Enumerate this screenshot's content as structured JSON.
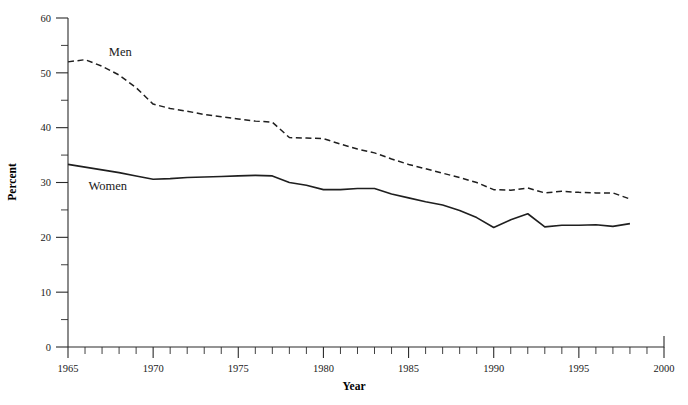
{
  "chart_data": {
    "type": "line",
    "title": "",
    "xlabel": "Year",
    "ylabel": "Percent",
    "xlim": [
      1965,
      2000
    ],
    "ylim": [
      0,
      60
    ],
    "grid": false,
    "legend_position": "inline-annotation",
    "x_major_ticks": [
      1965,
      1970,
      1975,
      1980,
      1985,
      1990,
      1995,
      2000
    ],
    "x_major_tick_labels": [
      "1965",
      "1970",
      "1975",
      "1980",
      "1985",
      "1990",
      "1995",
      "2000"
    ],
    "x_minor_tick_step": 1,
    "y_major_ticks": [
      0,
      10,
      20,
      30,
      40,
      50,
      60
    ],
    "y_major_tick_labels": [
      "0",
      "10",
      "20",
      "30",
      "40",
      "50",
      "60"
    ],
    "y_minor_tick_step": 5,
    "x": [
      1965,
      1966,
      1967,
      1968,
      1969,
      1970,
      1971,
      1972,
      1973,
      1974,
      1975,
      1976,
      1977,
      1978,
      1979,
      1980,
      1981,
      1982,
      1983,
      1984,
      1985,
      1986,
      1987,
      1988,
      1989,
      1990,
      1991,
      1992,
      1993,
      1994,
      1995,
      1996,
      1997,
      1998
    ],
    "series": [
      {
        "name": "Men",
        "style": "dashed",
        "label_annotation": "Men",
        "values": [
          52.0,
          52.4,
          51.2,
          49.6,
          47.3,
          44.3,
          43.5,
          43.0,
          42.4,
          42.0,
          41.6,
          41.2,
          41.0,
          38.2,
          38.1,
          38.0,
          37.0,
          36.1,
          35.4,
          34.3,
          33.3,
          32.5,
          31.7,
          30.9,
          30.0,
          28.7,
          28.6,
          29.0,
          28.1,
          28.4,
          28.2,
          28.1,
          28.1,
          27.0
        ]
      },
      {
        "name": "Women",
        "style": "solid",
        "label_annotation": "Women",
        "values": [
          33.3,
          32.8,
          32.3,
          31.8,
          31.2,
          30.6,
          30.7,
          30.9,
          31.0,
          31.1,
          31.2,
          31.3,
          31.2,
          30.0,
          29.5,
          28.7,
          28.7,
          28.9,
          28.9,
          27.9,
          27.2,
          26.5,
          25.9,
          24.9,
          23.6,
          21.8,
          23.2,
          24.3,
          21.9,
          22.2,
          22.2,
          22.3,
          22.0,
          22.5
        ]
      }
    ],
    "annotations": [
      {
        "text": "Men",
        "x": 1967.4,
        "y": 53.0
      },
      {
        "text": "Women",
        "x": 1966.2,
        "y": 28.6
      }
    ],
    "colors": {
      "axis": "#2b2b2b",
      "men_line": "#1f1f1f",
      "women_line": "#1f1f1f",
      "background": "#ffffff",
      "text": "#1a1a1a"
    }
  }
}
